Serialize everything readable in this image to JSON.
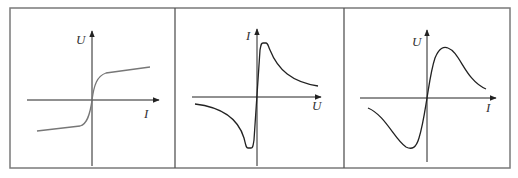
{
  "figure": {
    "frame": {
      "x": 10,
      "y": 8,
      "width": 500,
      "height": 160,
      "stroke": "#7a7a7a"
    },
    "dividers": [
      175,
      344
    ],
    "line_color": "#222222",
    "curve_color_panel1": "#777777",
    "panels": [
      {
        "id": "panel-1",
        "y_label": "U",
        "x_label": "I",
        "origin": [
          92,
          100
        ],
        "x_axis": [
          27,
          160
        ],
        "y_axis": [
          30,
          166
        ],
        "y_label_pos": [
          76,
          44
        ],
        "x_label_pos": [
          144,
          118
        ],
        "curve_description": "sigmoid: steep rise through origin, saturating flat at both ends"
      },
      {
        "id": "panel-2",
        "y_label": "I",
        "x_label": "U",
        "origin": [
          257,
          97
        ],
        "x_axis": [
          192,
          322
        ],
        "y_axis": [
          28,
          166
        ],
        "y_label_pos": [
          246,
          40
        ],
        "x_label_pos": [
          312,
          110
        ],
        "curve_description": "steep line through origin with sharp peaks, then decaying hyperbolic tails"
      },
      {
        "id": "panel-3",
        "y_label": "U",
        "x_label": "I",
        "origin": [
          427,
          98
        ],
        "x_axis": [
          360,
          497
        ],
        "y_axis": [
          29,
          162
        ],
        "y_label_pos": [
          412,
          46
        ],
        "x_label_pos": [
          486,
          112
        ],
        "curve_description": "smooth N-shaped curve: rises to peak, falls off; odd-symmetric trough"
      }
    ]
  }
}
